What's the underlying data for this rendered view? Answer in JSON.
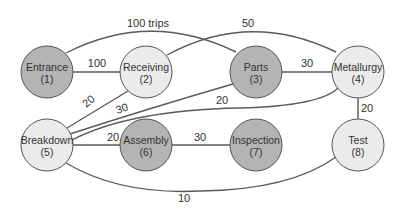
{
  "diagram": {
    "type": "flow-graph",
    "colors": {
      "dark_node": "#b4b4b4",
      "light_node": "#ebebeb",
      "edge": "#5a5a5a",
      "text": "#333333"
    },
    "nodes": [
      {
        "id": 1,
        "name": "Entrance",
        "num": "(1)",
        "shade": "dark"
      },
      {
        "id": 2,
        "name": "Receiving",
        "num": "(2)",
        "shade": "light"
      },
      {
        "id": 3,
        "name": "Parts",
        "num": "(3)",
        "shade": "dark"
      },
      {
        "id": 4,
        "name": "Metallurgy",
        "num": "(4)",
        "shade": "light"
      },
      {
        "id": 5,
        "name": "Breakdown",
        "num": "(5)",
        "shade": "light"
      },
      {
        "id": 6,
        "name": "Assembly",
        "num": "(6)",
        "shade": "dark"
      },
      {
        "id": 7,
        "name": "Inspection",
        "num": "(7)",
        "shade": "dark"
      },
      {
        "id": 8,
        "name": "Test",
        "num": "(8)",
        "shade": "light"
      }
    ],
    "edges": [
      {
        "from": 1,
        "to": 3,
        "label": "100 trips"
      },
      {
        "from": 2,
        "to": 4,
        "label": "50"
      },
      {
        "from": 1,
        "to": 2,
        "label": "100"
      },
      {
        "from": 3,
        "to": 4,
        "label": "30"
      },
      {
        "from": 2,
        "to": 5,
        "label": "20"
      },
      {
        "from": 5,
        "to": 3,
        "label": "30"
      },
      {
        "from": 5,
        "to": 4,
        "label": "20"
      },
      {
        "from": 5,
        "to": 6,
        "label": "20"
      },
      {
        "from": 6,
        "to": 7,
        "label": "30"
      },
      {
        "from": 4,
        "to": 8,
        "label": "20"
      },
      {
        "from": 5,
        "to": 8,
        "label": "10"
      }
    ]
  }
}
